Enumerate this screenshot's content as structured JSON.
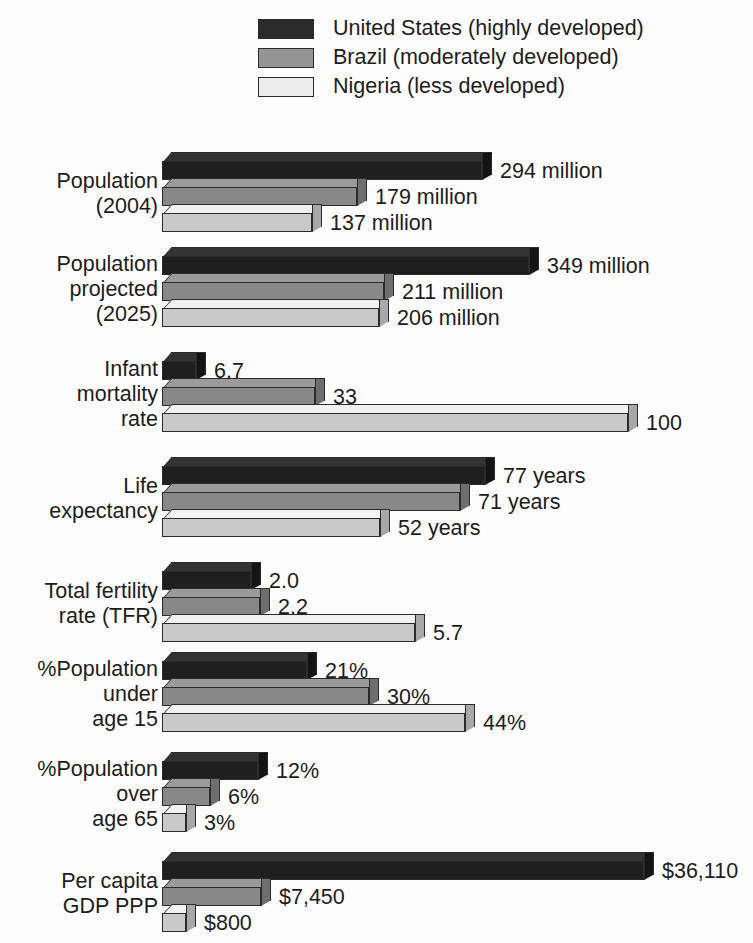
{
  "legend": {
    "items": [
      {
        "label": "United States (highly developed)",
        "color": "#2b2b2b",
        "key": "us"
      },
      {
        "label": "Brazil (moderately developed)",
        "color": "#949494",
        "key": "brazil"
      },
      {
        "label": "Nigeria (less developed)",
        "color": "#ededed",
        "key": "nigeria"
      }
    ]
  },
  "colors": {
    "us_top": "#333333",
    "us_front": "#1f1f1f",
    "us_side": "#141414",
    "brazil_top": "#9a9a9a",
    "brazil_front": "#888888",
    "brazil_side": "#6e6e6e",
    "nigeria_top": "#f2f2f2",
    "nigeria_front": "#c9c9c9",
    "nigeria_side": "#a8a8a8",
    "outline": "#2b2b2b",
    "text": "#1c1c1c",
    "background": "#fdfdfd"
  },
  "chart_data": {
    "type": "bar",
    "title": "",
    "subtitle": "",
    "xlabel": "",
    "ylabel": "",
    "orientation": "horizontal",
    "grid": false,
    "legend_position": "top",
    "note": "Each indicator group is scaled independently; bar lengths are relative within a group.",
    "series": [
      {
        "name": "United States (highly developed)",
        "key": "us"
      },
      {
        "name": "Brazil (moderately developed)",
        "key": "brazil"
      },
      {
        "name": "Nigeria (less developed)",
        "key": "nigeria"
      }
    ],
    "categories": [
      "Population (2004)",
      "Population projected (2025)",
      "Infant mortality rate",
      "Life expectancy",
      "Total fertility rate (TFR)",
      "%Population under age 15",
      "%Population over age 65",
      "Per capita GDP PPP"
    ],
    "groups": [
      {
        "id": "population-2004",
        "label_lines": [
          "Population",
          "(2004)"
        ],
        "top": 152,
        "height": 88,
        "bars": [
          {
            "series": "us",
            "value": 294,
            "unit": "million",
            "display": "294 million",
            "length": 320
          },
          {
            "series": "brazil",
            "value": 179,
            "unit": "million",
            "display": "179 million",
            "length": 195
          },
          {
            "series": "nigeria",
            "value": 137,
            "unit": "million",
            "display": "137 million",
            "length": 150
          }
        ]
      },
      {
        "id": "population-2025",
        "label_lines": [
          "Population",
          "projected",
          "(2025)"
        ],
        "top": 247,
        "height": 88,
        "bars": [
          {
            "series": "us",
            "value": 349,
            "unit": "million",
            "display": "349 million",
            "length": 367
          },
          {
            "series": "brazil",
            "value": 211,
            "unit": "million",
            "display": "211 million",
            "length": 222
          },
          {
            "series": "nigeria",
            "value": 206,
            "unit": "million",
            "display": "206 million",
            "length": 217
          }
        ]
      },
      {
        "id": "infant-mortality",
        "label_lines": [
          "Infant",
          "mortality",
          "rate"
        ],
        "top": 352,
        "height": 88,
        "bars": [
          {
            "series": "us",
            "value": 6.7,
            "unit": "",
            "display": "6.7",
            "length": 34
          },
          {
            "series": "brazil",
            "value": 33,
            "unit": "",
            "display": "33",
            "length": 153
          },
          {
            "series": "nigeria",
            "value": 100,
            "unit": "",
            "display": "100",
            "length": 466
          }
        ]
      },
      {
        "id": "life-expectancy",
        "label_lines": [
          "Life",
          "expectancy"
        ],
        "top": 457,
        "height": 88,
        "bars": [
          {
            "series": "us",
            "value": 77,
            "unit": "years",
            "display": "77 years",
            "length": 323
          },
          {
            "series": "brazil",
            "value": 71,
            "unit": "years",
            "display": "71 years",
            "length": 298
          },
          {
            "series": "nigeria",
            "value": 52,
            "unit": "years",
            "display": "52 years",
            "length": 218
          }
        ]
      },
      {
        "id": "total-fertility-rate",
        "label_lines": [
          "Total fertility",
          "rate (TFR)"
        ],
        "top": 562,
        "height": 88,
        "bars": [
          {
            "series": "us",
            "value": 2.0,
            "unit": "",
            "display": "2.0",
            "length": 89
          },
          {
            "series": "brazil",
            "value": 2.2,
            "unit": "",
            "display": "2.2",
            "length": 98
          },
          {
            "series": "nigeria",
            "value": 5.7,
            "unit": "",
            "display": "5.7",
            "length": 253
          }
        ]
      },
      {
        "id": "population-under-15",
        "label_lines": [
          "%Population",
          "under",
          "age 15"
        ],
        "top": 652,
        "height": 88,
        "bars": [
          {
            "series": "us",
            "value": 21,
            "unit": "%",
            "display": "21%",
            "length": 145
          },
          {
            "series": "brazil",
            "value": 30,
            "unit": "%",
            "display": "30%",
            "length": 207
          },
          {
            "series": "nigeria",
            "value": 44,
            "unit": "%",
            "display": "44%",
            "length": 303
          }
        ]
      },
      {
        "id": "population-over-65",
        "label_lines": [
          "%Population",
          "over",
          "age 65"
        ],
        "top": 752,
        "height": 88,
        "bars": [
          {
            "series": "us",
            "value": 12,
            "unit": "%",
            "display": "12%",
            "length": 96
          },
          {
            "series": "brazil",
            "value": 6,
            "unit": "%",
            "display": "6%",
            "length": 48
          },
          {
            "series": "nigeria",
            "value": 3,
            "unit": "%",
            "display": "3%",
            "length": 24
          }
        ]
      },
      {
        "id": "per-capita-gdp-ppp",
        "label_lines": [
          "Per capita",
          "GDP PPP"
        ],
        "top": 852,
        "height": 88,
        "bars": [
          {
            "series": "us",
            "value": 36110,
            "unit": "$",
            "display": "$36,110",
            "length": 482
          },
          {
            "series": "brazil",
            "value": 7450,
            "unit": "$",
            "display": "$7,450",
            "length": 99
          },
          {
            "series": "nigeria",
            "value": 800,
            "unit": "$",
            "display": "$800",
            "length": 24
          }
        ]
      }
    ]
  }
}
